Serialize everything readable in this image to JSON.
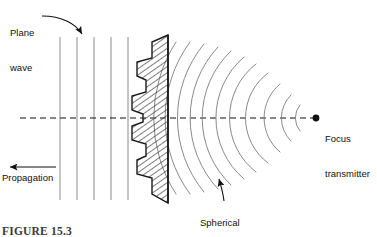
{
  "figure": {
    "caption": "FIGURE 15.3"
  },
  "labels": {
    "plane_wave_line1": "Plane",
    "plane_wave_line2": "wave",
    "propagation": "Propagation",
    "focus_line1": "Focus",
    "focus_line2": "transmitter",
    "spherical_line1": "Spherical",
    "spherical_line2": "wavefront"
  },
  "colors": {
    "ink": "#111111",
    "wave_line": "#8c8c8c",
    "arc_line": "#8a8a8a",
    "lens_outline": "#1a1a1a",
    "hatch": "#3a3a3a",
    "axis": "#111111",
    "background": "#ffffff"
  },
  "diagram": {
    "plane_wave": {
      "count": 5,
      "x_positions": [
        60,
        77,
        94,
        111,
        128
      ],
      "y_top": 37,
      "y_bottom": 200,
      "orientation": "vertical"
    },
    "axis": {
      "kind": "dashed-horizontal",
      "y": 118,
      "x_start": 20,
      "x_end": 316
    },
    "lens": {
      "kind": "stepped-fresnel-lens",
      "flat_face_x": 168,
      "y_top": 35,
      "y_bottom": 203,
      "steps": 8,
      "hatched": true
    },
    "spherical_wavefronts": {
      "count": 11,
      "focus_x": 316,
      "focus_y": 118,
      "radii": [
        140,
        128,
        116,
        104,
        92,
        80,
        68,
        56,
        44,
        32,
        20
      ]
    },
    "focus_point": {
      "x": 316,
      "y": 118
    },
    "propagation_arrow": {
      "x_from": 56,
      "x_to": 8,
      "y": 167,
      "direction": "left"
    },
    "plane_wave_arrow": {
      "from_x": 40,
      "from_y": 18,
      "to_x": 81,
      "to_y": 36,
      "style": "curved"
    },
    "spherical_arrow": {
      "x": 222,
      "y_from": 201,
      "y_to": 176,
      "direction": "up"
    }
  }
}
